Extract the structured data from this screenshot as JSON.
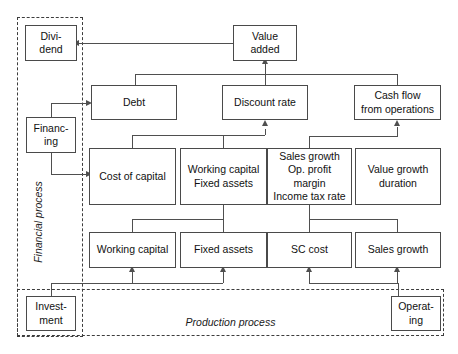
{
  "diagram": {
    "zones": [
      {
        "id": "financial",
        "label": "Financial process"
      },
      {
        "id": "production",
        "label": "Production process"
      }
    ],
    "nodes": {
      "dividend": "Divi-\ndend",
      "dividend_line1": "Divi-",
      "dividend_line2": "dend",
      "value_added_line1": "Value",
      "value_added_line2": "added",
      "financing_line1": "Financ-",
      "financing_line2": "ing",
      "debt": "Debt",
      "discount_rate": "Discount rate",
      "cash_flow_line1": "Cash flow",
      "cash_flow_line2": "from operations",
      "cost_of_capital": "Cost of capital",
      "wc_fa_line1": "Working capital",
      "wc_fa_line2": "Fixed assets",
      "drivers_line1": "Sales growth",
      "drivers_line2": "Op. profit",
      "drivers_line3": "margin",
      "drivers_line4": "Income tax rate",
      "value_growth_line1": "Value growth",
      "value_growth_line2": "duration",
      "working_capital": "Working capital",
      "fixed_assets": "Fixed assets",
      "sc_cost": "SC cost",
      "sales_growth": "Sales growth",
      "investment_line1": "Invest-",
      "investment_line2": "ment",
      "operating_line1": "Operat-",
      "operating_line2": "ing"
    },
    "colors": {
      "box_border": "#4a4a4a",
      "zone_border": "#3d3d3d",
      "connector": "#4f4f4f",
      "text": "#111111",
      "background": "#ffffff"
    }
  }
}
